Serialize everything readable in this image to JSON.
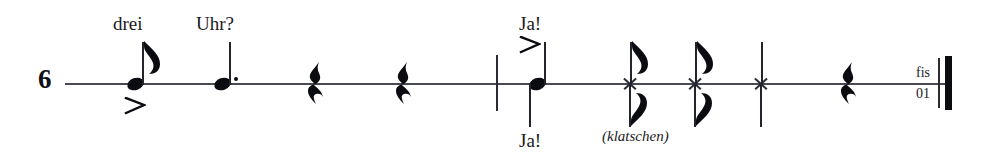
{
  "score": {
    "system_number": "6",
    "staff": {
      "x": 65,
      "y": 83,
      "width": 880
    },
    "lyrics": [
      {
        "text": "drei",
        "x": 113,
        "y": 14,
        "position": "above"
      },
      {
        "text": "Uhr?",
        "x": 196,
        "y": 14,
        "position": "above"
      },
      {
        "text": "Ja!",
        "x": 519,
        "y": 14,
        "position": "above"
      },
      {
        "text": "Ja!",
        "x": 519,
        "y": 131,
        "position": "below"
      }
    ],
    "technique_labels": [
      {
        "text": "(klatschen)",
        "x": 602,
        "y": 129
      }
    ],
    "end_labels": {
      "top": "fis",
      "bottom": "01",
      "x": 908,
      "y": 66
    },
    "notes": [
      {
        "id": "note-1",
        "kind": "eighth",
        "head": "round",
        "x": 135,
        "stem": "up",
        "flag": true,
        "dotted": false,
        "accent": "below",
        "lyric": "drei"
      },
      {
        "id": "note-2",
        "kind": "dotted-quarter",
        "head": "round",
        "x": 222,
        "stem": "up",
        "flag": false,
        "dotted": true,
        "accent": "none",
        "lyric": "Uhr?"
      },
      {
        "id": "note-3",
        "kind": "quarter",
        "head": "round",
        "x": 537,
        "stem": "both",
        "flag": false,
        "dotted": false,
        "accent": "above",
        "lyric": "Ja!"
      },
      {
        "id": "note-4",
        "kind": "eighth",
        "head": "cross",
        "x": 630,
        "stem": "both",
        "flag": true,
        "dotted": false,
        "accent": "none",
        "lyric": ""
      },
      {
        "id": "note-5",
        "kind": "eighth",
        "head": "cross",
        "x": 695,
        "stem": "both",
        "flag": true,
        "dotted": false,
        "accent": "none",
        "lyric": ""
      },
      {
        "id": "note-6",
        "kind": "quarter",
        "head": "cross",
        "x": 761,
        "stem": "both",
        "flag": false,
        "dotted": false,
        "accent": "none",
        "lyric": ""
      }
    ],
    "rests": [
      {
        "id": "rest-1",
        "kind": "quarter",
        "x": 305
      },
      {
        "id": "rest-2",
        "kind": "quarter",
        "x": 393
      },
      {
        "id": "rest-3",
        "kind": "quarter",
        "x": 838
      }
    ],
    "barlines": [
      {
        "id": "barline-mid",
        "kind": "thin",
        "x": 496,
        "y": 55,
        "height": 56
      },
      {
        "id": "final-thin",
        "kind": "thin",
        "x": 938,
        "y": 58,
        "height": 50
      },
      {
        "id": "final-thick",
        "kind": "thick",
        "x": 945,
        "y": 56,
        "height": 54
      }
    ],
    "colors": {
      "ink": "#0b0b12",
      "staff": "#4a4a52",
      "stem": "#23232b",
      "paper": "#ffffff"
    }
  }
}
